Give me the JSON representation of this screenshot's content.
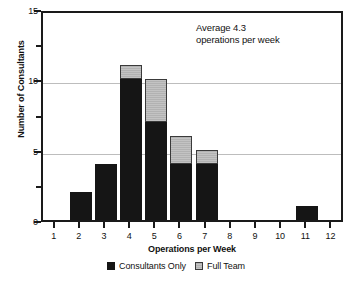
{
  "chart_data": {
    "type": "bar",
    "stacked": true,
    "title": "",
    "xlabel": "Operations per Week",
    "ylabel": "Number of Consultants",
    "categories": [
      "1",
      "2",
      "3",
      "4",
      "5",
      "6",
      "7",
      "8",
      "9",
      "10",
      "11",
      "12"
    ],
    "series": [
      {
        "name": "Consultants Only",
        "color": "#151515",
        "values": [
          0,
          2,
          4,
          10,
          7,
          4,
          4,
          0,
          0,
          0,
          1,
          0
        ]
      },
      {
        "name": "Full Team",
        "color": "#bdbdbd",
        "values": [
          0,
          0,
          0,
          1,
          3,
          2,
          1,
          0,
          0,
          0,
          0,
          0
        ]
      }
    ],
    "totals": [
      0,
      2,
      4,
      11,
      10,
      6,
      5,
      0,
      0,
      0,
      1,
      0
    ],
    "ylim": [
      0,
      15
    ],
    "yticks": [
      0,
      5,
      10,
      15
    ],
    "ytick_labels": [
      "0",
      "5",
      "10",
      "15"
    ],
    "yminor_ticks": [
      2.5,
      7.5,
      12.5
    ],
    "gridlines": [
      5,
      10
    ],
    "grid": true,
    "legend_position": "bottom"
  },
  "axes": {
    "y_title": "Number of Consultants",
    "x_title": "Operations per Week",
    "y_tick_labels": [
      "0",
      "5",
      "10",
      "15"
    ],
    "x_tick_labels": [
      "1",
      "2",
      "3",
      "4",
      "5",
      "6",
      "7",
      "8",
      "9",
      "10",
      "11",
      "12"
    ]
  },
  "annotation": {
    "line1": "Average 4.3",
    "line2": "operations per week"
  },
  "legend": {
    "items": [
      {
        "label": "Consultants Only",
        "swatch": "black-square-icon"
      },
      {
        "label": "Full Team",
        "swatch": "gray-square-icon"
      }
    ]
  },
  "colors": {
    "consultants_only": "#151515",
    "full_team": "#bdbdbd",
    "axis": "#1a1a1a",
    "grid": "#bdbdbd",
    "background": "#ffffff"
  }
}
